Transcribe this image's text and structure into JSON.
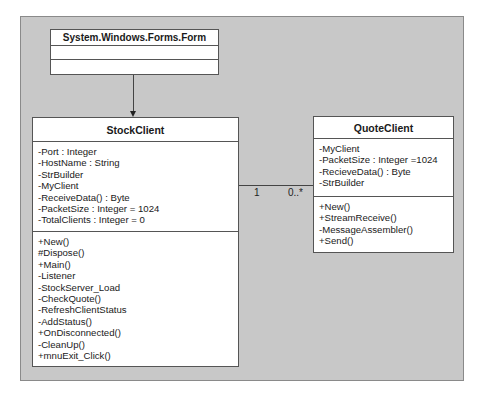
{
  "diagram": {
    "type": "uml-class-diagram",
    "colors": {
      "frame_bg": "#c8c8c8",
      "box_bg": "#ffffff",
      "border": "#555555"
    }
  },
  "classes": {
    "form": {
      "name": "System.Windows.Forms.Form",
      "attributes": [],
      "operations": []
    },
    "stock_client": {
      "name": "StockClient",
      "attributes": [
        "-Port : Integer",
        "-HostName : String",
        "-StrBuilder",
        "-MyClient",
        "-ReceiveData() : Byte",
        "-PacketSize : Integer = 1024",
        "-TotalClients : Integer = 0"
      ],
      "operations": [
        "+New()",
        "#Dispose()",
        "+Main()",
        "-Listener",
        "-StockServer_Load",
        "-CheckQuote()",
        "-RefreshClientStatus",
        "-AddStatus()",
        "+OnDisconnected()",
        "-CleanUp()",
        "+mnuExit_Click()"
      ]
    },
    "quote_client": {
      "name": "QuoteClient",
      "attributes": [
        "-MyClient",
        "-PacketSize : Integer =1024",
        "-RecieveData() : Byte",
        "-StrBuilder"
      ],
      "operations": [
        "+New()",
        "+StreamReceive()",
        "-MessageAssembler()",
        "+Send()"
      ]
    }
  },
  "relationships": {
    "inheritance": {
      "from": "StockClient",
      "to": "System.Windows.Forms.Form"
    },
    "association": {
      "from": "StockClient",
      "to": "QuoteClient",
      "source_multiplicity": "1",
      "target_multiplicity": "0..*"
    }
  }
}
